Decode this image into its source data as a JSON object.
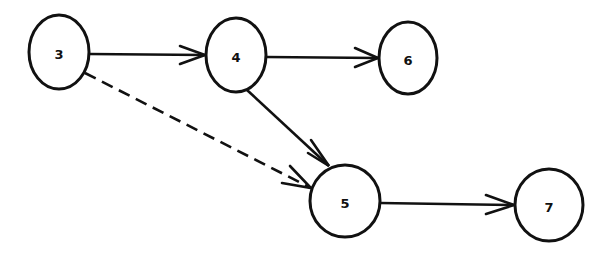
{
  "diagram": {
    "type": "directed-network",
    "nodes": [
      {
        "id": "3",
        "label": "3",
        "cx": 59,
        "cy": 52,
        "rx": 30,
        "ry": 37
      },
      {
        "id": "4",
        "label": "4",
        "cx": 236,
        "cy": 55,
        "rx": 30,
        "ry": 37
      },
      {
        "id": "6",
        "label": "6",
        "cx": 408,
        "cy": 58,
        "rx": 29,
        "ry": 36
      },
      {
        "id": "5",
        "label": "5",
        "cx": 345,
        "cy": 201,
        "rx": 35,
        "ry": 36
      },
      {
        "id": "7",
        "label": "7",
        "cx": 549,
        "cy": 205,
        "rx": 34,
        "ry": 36
      }
    ],
    "edges": [
      {
        "from": "3",
        "to": "4",
        "style": "solid"
      },
      {
        "from": "4",
        "to": "6",
        "style": "solid"
      },
      {
        "from": "4",
        "to": "5",
        "style": "solid"
      },
      {
        "from": "3",
        "to": "5",
        "style": "dashed"
      },
      {
        "from": "5",
        "to": "7",
        "style": "solid"
      }
    ]
  }
}
